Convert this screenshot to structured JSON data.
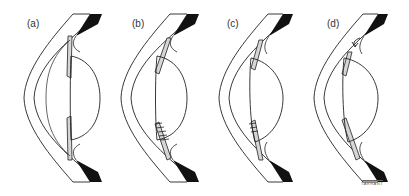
{
  "figure": {
    "panels": [
      {
        "id": "a",
        "label": "(a)",
        "variant": "normal"
      },
      {
        "id": "b",
        "label": "(b)",
        "variant": "lower-folds"
      },
      {
        "id": "c",
        "label": "(c)",
        "variant": "lower-folds-small"
      },
      {
        "id": "d",
        "label": "(d)",
        "variant": "upper-arrow"
      }
    ],
    "signature": "TARRANT",
    "colors": {
      "outline": "#222222",
      "pigment": "#111111",
      "iris_fill": "#d6d6d6",
      "background": "#ffffff"
    }
  }
}
